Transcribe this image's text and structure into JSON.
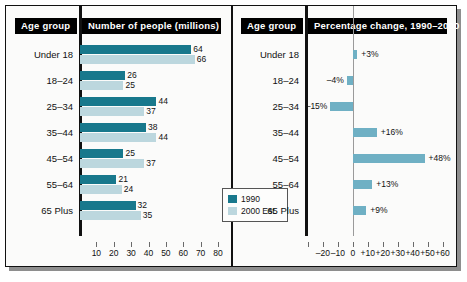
{
  "figure": {
    "left_panel": {
      "age_group_header": "Age group",
      "title": "Number of people (millions)",
      "legend": [
        {
          "label": "1990",
          "color": "#18788c"
        },
        {
          "label": "2000 Est.",
          "color": "#bcd7de"
        }
      ]
    },
    "right_panel": {
      "age_group_header": "Age group",
      "title": "Percentage change, 1990–2000"
    }
  },
  "chart_data": [
    {
      "type": "bar",
      "orientation": "horizontal",
      "title": "Number of people (millions)",
      "xlabel": "",
      "ylabel": "Age group",
      "categories": [
        "Under 18",
        "18–24",
        "25–34",
        "35–44",
        "45–54",
        "55–64",
        "65 Plus"
      ],
      "series": [
        {
          "name": "1990",
          "color": "#18788c",
          "values": [
            64,
            26,
            44,
            38,
            25,
            21,
            32
          ]
        },
        {
          "name": "2000 Est.",
          "color": "#bcd7de",
          "values": [
            66,
            25,
            37,
            44,
            37,
            24,
            35
          ]
        }
      ],
      "xlim": [
        0,
        80
      ],
      "xticks": [
        10,
        20,
        30,
        40,
        50,
        60,
        70,
        80
      ],
      "xticklabels": [
        "10",
        "20",
        "30",
        "40",
        "50",
        "60",
        "70",
        "80"
      ],
      "grid": false,
      "legend_position": "inside-right"
    },
    {
      "type": "bar",
      "orientation": "horizontal",
      "title": "Percentage change, 1990–2000",
      "xlabel": "",
      "ylabel": "Age group",
      "categories": [
        "Under 18",
        "18–24",
        "25–34",
        "35–44",
        "45–54",
        "55–64",
        "65 Plus"
      ],
      "values": [
        3,
        -4,
        -15,
        16,
        48,
        13,
        9
      ],
      "datalabels": [
        "+3%",
        "–4%",
        "–15%",
        "+16%",
        "+48%",
        "+13%",
        "+9%"
      ],
      "color": "#6fb0c4",
      "xlim": [
        -32,
        63
      ],
      "xticks": [
        -30,
        -20,
        -10,
        0,
        10,
        20,
        30,
        40,
        50,
        60
      ],
      "xticklabels": [
        "",
        "–20",
        "–10",
        "0",
        "+10",
        "+20",
        "+30",
        "+40",
        "+50",
        "+60"
      ],
      "grid": false,
      "legend_position": "none"
    }
  ]
}
